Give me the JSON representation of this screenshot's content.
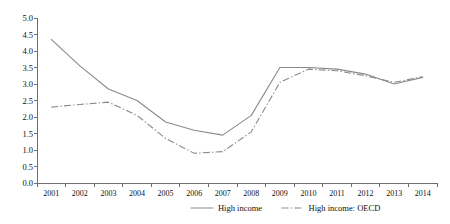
{
  "chart_data": {
    "type": "line",
    "title": "",
    "subtitle": "",
    "xlabel": "",
    "ylabel": "",
    "categories": [
      "2001",
      "2002",
      "2003",
      "2004",
      "2005",
      "2006",
      "2007",
      "2008",
      "2009",
      "2010",
      "2011",
      "2012",
      "2013",
      "2014"
    ],
    "ylim": [
      0.0,
      5.0
    ],
    "ytick_labels": [
      "0.0",
      "0.5",
      "1.0",
      "1.5",
      "2.0",
      "2.5",
      "3.0",
      "3.5",
      "4.0",
      "4.5",
      "5.0"
    ],
    "ytick_values": [
      0.0,
      0.5,
      1.0,
      1.5,
      2.0,
      2.5,
      3.0,
      3.5,
      4.0,
      4.5,
      5.0
    ],
    "grid": false,
    "legend_position": "bottom",
    "series": [
      {
        "name": "High income",
        "style": "solid",
        "color": "#8a8a8a",
        "values": [
          4.35,
          3.55,
          2.85,
          2.5,
          1.85,
          1.6,
          1.45,
          2.05,
          3.5,
          3.5,
          3.45,
          3.3,
          3.0,
          3.2
        ]
      },
      {
        "name": "High income: OECD",
        "style": "dash-dot",
        "color": "#8a8a8a",
        "values": [
          2.3,
          2.38,
          2.45,
          2.05,
          1.35,
          0.9,
          0.95,
          1.55,
          3.05,
          3.45,
          3.4,
          3.25,
          3.05,
          3.22
        ]
      }
    ]
  },
  "legend": {
    "items": [
      {
        "label": "High income",
        "style": "solid"
      },
      {
        "label": "High income: OECD",
        "style": "dash-dot"
      }
    ]
  }
}
